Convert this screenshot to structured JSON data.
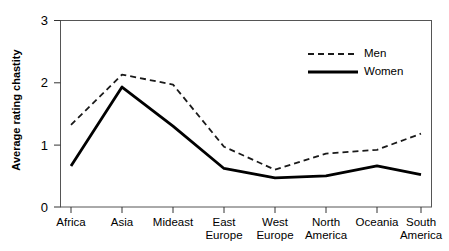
{
  "chart_data": {
    "type": "line",
    "title": "",
    "xlabel": "",
    "ylabel": "Average rating chastity",
    "ylim": [
      0,
      3
    ],
    "yticks": [
      0,
      1,
      2,
      3
    ],
    "ytick_labels": [
      "0",
      "1",
      "2",
      "3"
    ],
    "grid": false,
    "legend_position": "top-right",
    "categories": [
      "Africa",
      "Asia",
      "Mideast",
      "East\nEurope",
      "West\nEurope",
      "North\nAmerica",
      "Oceania",
      "South\nAmerica"
    ],
    "series": [
      {
        "name": "Men",
        "style": "dashed",
        "color": "#1a1a1a",
        "values": [
          1.32,
          2.13,
          1.97,
          0.97,
          0.6,
          0.86,
          0.92,
          1.18
        ]
      },
      {
        "name": "Women",
        "style": "solid",
        "color": "#000000",
        "values": [
          0.66,
          1.93,
          1.3,
          0.62,
          0.47,
          0.5,
          0.66,
          0.52
        ]
      }
    ]
  },
  "legend": {
    "entries": [
      {
        "label": "Men"
      },
      {
        "label": "Women"
      }
    ]
  },
  "axes": {
    "y_label": "Average rating chastity",
    "y_tick_0": "0",
    "y_tick_1": "1",
    "y_tick_2": "2",
    "y_tick_3": "3",
    "x_label_0": "Africa",
    "x_label_1": "Asia",
    "x_label_2": "Mideast",
    "x_label_3": "East\nEurope",
    "x_label_4": "West\nEurope",
    "x_label_5": "North\nAmerica",
    "x_label_6": "Oceania",
    "x_label_7": "South\nAmerica"
  },
  "colors": {
    "frame": "#4d4d4d",
    "men_line": "#1a1a1a",
    "women_line": "#000000",
    "text": "#000000",
    "background": "#ffffff"
  }
}
